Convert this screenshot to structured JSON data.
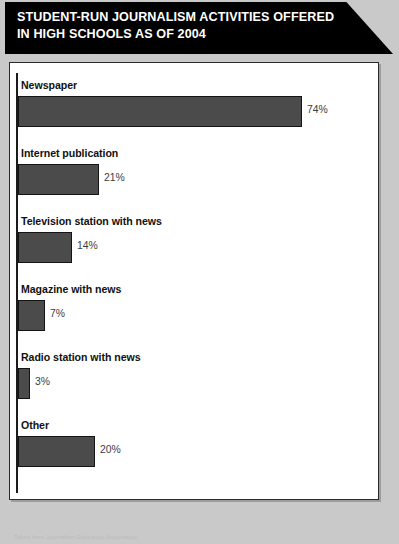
{
  "poster": {
    "title": "STUDENT-RUN JOURNALISM ACTIVITIES OFFERED IN HIGH SCHOOLS AS OF 2004",
    "background_color": "#c9c9c9",
    "banner_color": "#000000",
    "banner_text_color": "#ffffff",
    "panel_color": "#ffffff"
  },
  "footer": {
    "source_note": "Taken from Journalism Education Association"
  },
  "chart_data": {
    "type": "bar",
    "orientation": "horizontal",
    "title": "STUDENT-RUN JOURNALISM ACTIVITIES OFFERED IN HIGH SCHOOLS AS OF 2004",
    "xlabel": "",
    "ylabel": "",
    "xlim": [
      0,
      80
    ],
    "grid": false,
    "legend": false,
    "bar_color": "#4b4b4b",
    "bar_border_color": "#141414",
    "value_suffix": "%",
    "categories": [
      "Newspaper",
      "Internet publication",
      "Television station with news",
      "Magazine with news",
      "Radio station with news",
      "Other"
    ],
    "values": [
      74,
      21,
      14,
      7,
      3,
      20
    ],
    "value_labels": [
      "74%",
      "21%",
      "14%",
      "7%",
      "3%",
      "20%"
    ]
  }
}
